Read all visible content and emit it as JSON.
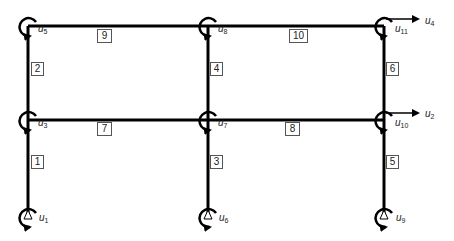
{
  "diagram": {
    "type": "plane frame",
    "colors": {
      "line": "#000000",
      "label_border": "#555555",
      "text": "#222222",
      "background": "#ffffff"
    },
    "members": [
      {
        "id": "1",
        "label": "1",
        "x": 31,
        "y": 155,
        "w": 11
      },
      {
        "id": "2",
        "label": "2",
        "x": 31,
        "y": 62,
        "w": 11
      },
      {
        "id": "3",
        "label": "3",
        "x": 210,
        "y": 155,
        "w": 11
      },
      {
        "id": "4",
        "label": "4",
        "x": 210,
        "y": 62,
        "w": 11
      },
      {
        "id": "5",
        "label": "5",
        "x": 386,
        "y": 155,
        "w": 11
      },
      {
        "id": "6",
        "label": "6",
        "x": 386,
        "y": 62,
        "w": 11
      },
      {
        "id": "7",
        "label": "7",
        "x": 97,
        "y": 122,
        "w": 13
      },
      {
        "id": "8",
        "label": "8",
        "x": 285,
        "y": 122,
        "w": 13
      },
      {
        "id": "9",
        "label": "9",
        "x": 97,
        "y": 29,
        "w": 13
      },
      {
        "id": "10",
        "label": "10",
        "x": 289,
        "y": 29,
        "w": 17
      }
    ],
    "dofs": [
      {
        "base": "u",
        "sub": "1",
        "x": 39,
        "y": 219
      },
      {
        "base": "u",
        "sub": "3",
        "x": 38,
        "y": 124
      },
      {
        "base": "u",
        "sub": "5",
        "x": 38,
        "y": 30
      },
      {
        "base": "u",
        "sub": "6",
        "x": 219,
        "y": 219
      },
      {
        "base": "u",
        "sub": "7",
        "x": 218,
        "y": 124
      },
      {
        "base": "u",
        "sub": "8",
        "x": 218,
        "y": 30
      },
      {
        "base": "u",
        "sub": "9",
        "x": 396,
        "y": 219
      },
      {
        "base": "u",
        "sub": "10",
        "x": 395,
        "y": 124
      },
      {
        "base": "u",
        "sub": "11",
        "x": 395,
        "y": 30
      },
      {
        "base": "u",
        "sub": "2",
        "x": 425,
        "y": 113
      },
      {
        "base": "u",
        "sub": "4",
        "x": 425,
        "y": 20
      }
    ]
  }
}
